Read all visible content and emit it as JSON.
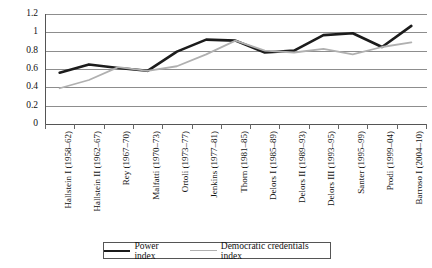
{
  "chart_data": {
    "type": "line",
    "title": "",
    "xlabel": "",
    "ylabel": "",
    "ylim": [
      0,
      1.2
    ],
    "ytick_values": [
      0,
      0.2,
      0.4,
      0.6,
      0.8,
      1,
      1.2
    ],
    "ytick_labels": [
      "0",
      "0.2",
      "0.4",
      "0.6",
      "0.8",
      "1",
      "1.2"
    ],
    "grid": true,
    "legend_position": "bottom",
    "categories": [
      "Hallstein I (1958–62)",
      "Hallstein II (1962–67)",
      "Rey (1967–70)",
      "Malfatti (1970–73)",
      "Ortoli (1973–77)",
      "Jenkins (1977–81)",
      "Thorn (1981–85)",
      "Delors I (1985–89)",
      "Delors II (1989–93)",
      "Delors III (1993–95)",
      "Santer (1995–99)",
      "Prodi (1999–04)",
      "Barroso I (2004–10)"
    ],
    "series": [
      {
        "name": "Power index",
        "color": "#1c1c1c",
        "width": 2.6,
        "values": [
          0.56,
          0.65,
          0.61,
          0.58,
          0.79,
          0.92,
          0.91,
          0.78,
          0.8,
          0.97,
          0.99,
          0.84,
          1.07
        ]
      },
      {
        "name": "Democratic credentials index",
        "color": "#b0b0b0",
        "width": 1.8,
        "values": [
          0.39,
          0.48,
          0.62,
          0.58,
          0.63,
          0.76,
          0.91,
          0.8,
          0.78,
          0.82,
          0.76,
          0.84,
          0.89
        ]
      }
    ]
  },
  "legend": {
    "entries": [
      {
        "label": "Power index",
        "swatch": "power-line-swatch"
      },
      {
        "label": "Democratic credentials index",
        "swatch": "democratic-line-swatch"
      }
    ]
  },
  "colors": {
    "power_index": "#1c1c1c",
    "democratic_credentials_index": "#b0b0b0",
    "gridline": "#8d8d8d",
    "axis": "#555555",
    "background": "#ffffff"
  }
}
